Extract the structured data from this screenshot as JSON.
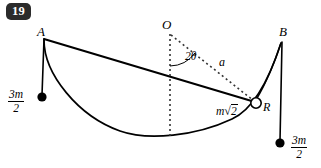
{
  "figure": {
    "problem_number": "19",
    "type": "physics-mechanics-diagram",
    "points": {
      "A": {
        "label": "A",
        "x": 44,
        "y": 40
      },
      "O": {
        "label": "O",
        "x": 170,
        "y": 34
      },
      "B": {
        "label": "B",
        "x": 283,
        "y": 42
      },
      "R": {
        "label": "R",
        "x": 256,
        "y": 103
      }
    },
    "angle": {
      "label": "2θ",
      "vertex": "O",
      "between": [
        "vertical-from-O",
        "radius-OR"
      ]
    },
    "radius": {
      "label": "a",
      "from": "O",
      "to": "R"
    },
    "ring": {
      "label": "R",
      "mass_label_prefix": "m",
      "mass_label_radical": "√",
      "mass_label_radicand": "2"
    },
    "masses": [
      {
        "name": "left-mass",
        "numerator": "3m",
        "denominator": "2",
        "dot_x": 42,
        "dot_y": 97
      },
      {
        "name": "right-mass",
        "numerator": "3m",
        "denominator": "2",
        "dot_x": 280,
        "dot_y": 143
      }
    ],
    "colors": {
      "ink": "#000000",
      "badge_background": "#2b2b2b",
      "badge_text": "#ffffff",
      "paper": "#ffffff"
    }
  }
}
